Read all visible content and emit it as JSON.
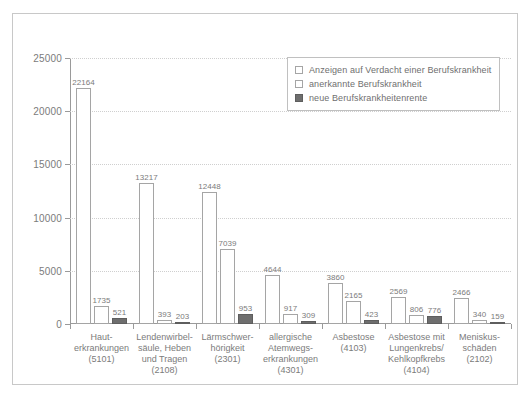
{
  "chart_data": {
    "type": "bar",
    "title": "",
    "xlabel": "",
    "ylabel": "",
    "ylim": [
      0,
      25000
    ],
    "yticks": [
      "0",
      "5000",
      "10000",
      "15000",
      "20000",
      "25000"
    ],
    "ytick_values": [
      0,
      5000,
      10000,
      15000,
      20000,
      25000
    ],
    "grid": true,
    "legend_position": "top-right",
    "categories": [
      "Haut-\nerkrankungen\n(5101)",
      "Lendenwirbel-\nsäule, Heben\nund Tragen\n(2108)",
      "Lärmschwer-\nhörigkeit\n(2301)",
      "allergische\nAtemwegs-\nerkrankungen\n(4301)",
      "Asbestose\n(4103)",
      "Asbestose mit\nLungenkrebs/\nKehlkopfkrebs\n(4104)",
      "Meniskus-\nschäden\n(2102)"
    ],
    "series": [
      {
        "name": "Anzeigen auf Verdacht einer Berufskrankheit",
        "color": "#ffffff",
        "values": [
          22164,
          13217,
          12448,
          4644,
          3860,
          2569,
          2466
        ],
        "labels": [
          "22164",
          "13217",
          "12448",
          "4644",
          "3860",
          "2569",
          "2466"
        ]
      },
      {
        "name": "anerkannte Berufskrankheit",
        "color": "#ffffff",
        "values": [
          1735,
          393,
          7039,
          917,
          2165,
          806,
          340
        ],
        "labels": [
          "1735",
          "393",
          "7039",
          "917",
          "2165",
          "806",
          "340"
        ]
      },
      {
        "name": "neue Berufskrankheitenrente",
        "color": "#6e6e6e",
        "values": [
          521,
          203,
          953,
          309,
          423,
          776,
          159
        ],
        "labels": [
          "521",
          "203",
          "953",
          "309",
          "423",
          "776",
          "159"
        ]
      }
    ]
  },
  "legend": {
    "items": [
      {
        "label": "Anzeigen auf Verdacht einer Berufskrankheit",
        "swatch": "open"
      },
      {
        "label": "anerkannte Berufskrankheit",
        "swatch": "open"
      },
      {
        "label": "neue Berufskrankheitenrente",
        "swatch": "filled"
      }
    ]
  }
}
